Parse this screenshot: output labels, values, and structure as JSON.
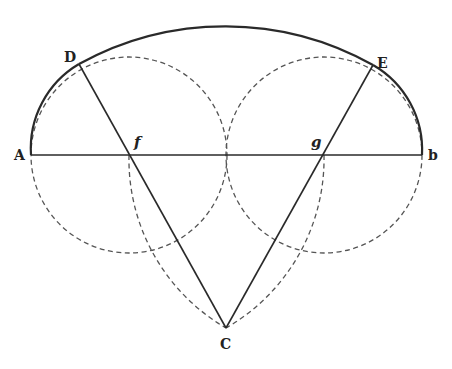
{
  "diagram": {
    "type": "geometric-construction",
    "colors": {
      "ink": "#2a2a2a",
      "dashed": "#555555",
      "background": "#ffffff"
    },
    "points": {
      "A": {
        "label": "A",
        "x": 31,
        "y": 155
      },
      "B": {
        "label": "b",
        "x": 422,
        "y": 155
      },
      "C": {
        "label": "C",
        "x": 226,
        "y": 328
      },
      "D": {
        "label": "D",
        "x": 79,
        "y": 64
      },
      "E": {
        "label": "E",
        "x": 373,
        "y": 65
      },
      "f": {
        "label": "f",
        "x": 129,
        "y": 155
      },
      "g": {
        "label": "g",
        "x": 324,
        "y": 155
      }
    },
    "solid_lines": [
      {
        "from": "A",
        "to": "B"
      },
      {
        "from": "D",
        "to": "C"
      },
      {
        "from": "E",
        "to": "C"
      }
    ],
    "solid_arcs": [
      {
        "name": "arc-A-D",
        "center": "f",
        "radius": 98
      },
      {
        "name": "arc-D-E",
        "center": "C",
        "radius": 302
      },
      {
        "name": "arc-E-B",
        "center": "g",
        "radius": 98
      }
    ],
    "dashed_circles": [
      {
        "name": "circle-f",
        "center": "f",
        "radius": 98
      },
      {
        "name": "circle-g",
        "center": "g",
        "radius": 98
      }
    ],
    "dashed_arcs": [
      {
        "name": "arc-f-to-C",
        "center": "g",
        "radius": 195
      },
      {
        "name": "arc-g-to-C",
        "center": "f",
        "radius": 195
      }
    ]
  }
}
